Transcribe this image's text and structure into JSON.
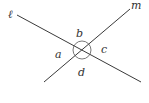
{
  "diagram": {
    "type": "intersecting-lines",
    "colors": {
      "line": "#3a3a3a",
      "arc": "#555555",
      "text": "#333333",
      "background": "#ffffff"
    },
    "lines": [
      {
        "name": "ℓ",
        "x1": 17,
        "y1": 15,
        "x2": 141,
        "y2": 82
      },
      {
        "name": "m",
        "x1": 44,
        "y1": 82,
        "x2": 130,
        "y2": 9
      }
    ],
    "intersection": {
      "x": 82,
      "y": 50
    },
    "angle_marker_radius": 9,
    "line_labels": [
      {
        "text": "ℓ",
        "x": 8,
        "y": 18
      },
      {
        "text": "m",
        "x": 131,
        "y": 9
      }
    ],
    "angle_labels": [
      {
        "text": "a",
        "x": 55,
        "y": 58
      },
      {
        "text": "b",
        "x": 76,
        "y": 37
      },
      {
        "text": "c",
        "x": 101,
        "y": 53
      },
      {
        "text": "d",
        "x": 78,
        "y": 76
      }
    ]
  }
}
